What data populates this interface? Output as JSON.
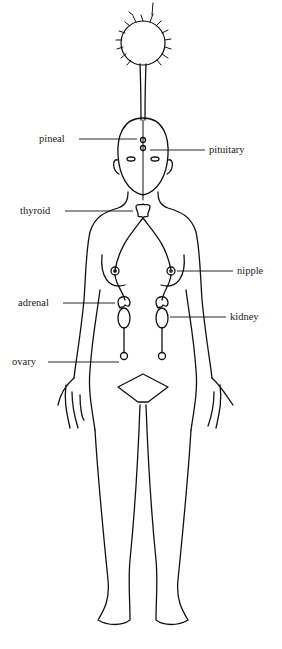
{
  "diagram": {
    "line_color": "#111111",
    "background": "#ffffff",
    "labels": [
      {
        "id": "pineal",
        "text": "pineal",
        "x": 39,
        "y": 134
      },
      {
        "id": "pituitary",
        "text": "pituitary",
        "x": 209,
        "y": 145
      },
      {
        "id": "thyroid",
        "text": "thyroid",
        "x": 20,
        "y": 206
      },
      {
        "id": "nipple",
        "text": "nipple",
        "x": 237,
        "y": 266
      },
      {
        "id": "adrenal",
        "text": "adrenal",
        "x": 18,
        "y": 298
      },
      {
        "id": "kidney",
        "text": "kidney",
        "x": 230,
        "y": 312
      },
      {
        "id": "ovary",
        "text": "ovary",
        "x": 12,
        "y": 357
      }
    ]
  }
}
